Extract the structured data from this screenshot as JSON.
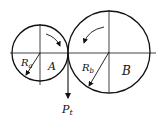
{
  "diagram": {
    "type": "gear-pair-force",
    "gear_a": {
      "label": "A",
      "radius_label_main": "R",
      "radius_label_sub": "a",
      "rotation": "clockwise"
    },
    "gear_b": {
      "label": "B",
      "radius_label_main": "R",
      "radius_label_sub": "b",
      "rotation": "counterclockwise"
    },
    "force": {
      "label_main": "P",
      "label_sub": "t",
      "direction": "down"
    },
    "colors": {
      "stroke": "#111111",
      "background": "#ffffff"
    }
  }
}
